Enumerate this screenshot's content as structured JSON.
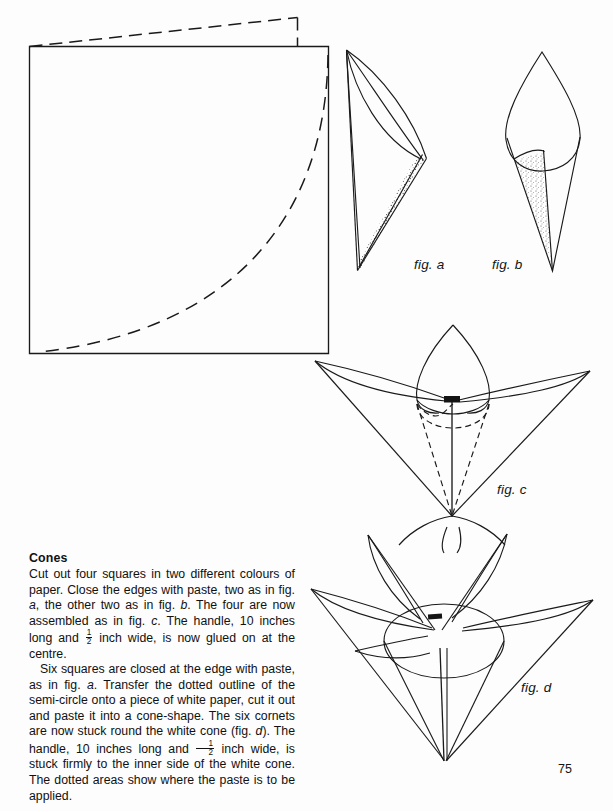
{
  "page": {
    "number": "75",
    "width": 613,
    "height": 811,
    "background_color": "#fdfdfd",
    "ink_color": "#141414"
  },
  "section": {
    "heading": "Cones",
    "paragraphs": [
      {
        "id": "paragraph-1",
        "indented": false,
        "runs": [
          {
            "type": "text",
            "text": "Cut out four squares in two different colours of paper. Close the edges with paste, two as in fig. "
          },
          {
            "type": "italic",
            "text": "a"
          },
          {
            "type": "text",
            "text": ", the other two as in fig. "
          },
          {
            "type": "italic",
            "text": "b"
          },
          {
            "type": "text",
            "text": ". The four are now assembled as in fig. "
          },
          {
            "type": "italic",
            "text": "c"
          },
          {
            "type": "text",
            "text": ". The handle, 10 inches long and "
          },
          {
            "type": "fraction",
            "numerator": "1",
            "denominator": "2"
          },
          {
            "type": "text",
            "text": " inch wide, is now glued on at the centre."
          }
        ]
      },
      {
        "id": "paragraph-2",
        "indented": true,
        "runs": [
          {
            "type": "text",
            "text": "Six squares are closed at the edge with paste, as in fig. "
          },
          {
            "type": "italic",
            "text": "a"
          },
          {
            "type": "text",
            "text": ". Transfer the dotted outline of the semi-circle onto a piece of white paper, cut it out and paste it into a cone-shape. The six cornets are now stuck round the white cone (fig. "
          },
          {
            "type": "italic",
            "text": "d"
          },
          {
            "type": "text",
            "text": "). The handle, 10 inches long and "
          },
          {
            "type": "fraction",
            "numerator": "1",
            "denominator": "2"
          },
          {
            "type": "text",
            "text": " inch wide, is stuck firmly to the inner side of the white cone. The dotted areas show where the paste is to be applied."
          }
        ]
      }
    ]
  },
  "figures": {
    "square_pattern": {
      "name": "paper-square-with-quarter-circle",
      "caption": "",
      "description": "Square sheet of paper with a dashed quarter-circle arc from top-right corner to bottom-left corner, plus a dashed fold/offset outline above the top edge."
    },
    "fig_a": {
      "caption": "fig. a",
      "description": "Single cornet folded as a pointed cone, dotted paste strip along the lower right edge."
    },
    "fig_b": {
      "caption": "fig. b",
      "description": "Cornet with rounded leaf head and a narrow stippled paste cone below."
    },
    "fig_c": {
      "caption": "fig. c",
      "description": "Four cornets assembled into a flower with hidden dashed cone outline and dark handle mark at the centre."
    },
    "fig_d": {
      "caption": "fig. d",
      "description": "Six cornets stuck around the white cone forming the finished flower."
    }
  }
}
